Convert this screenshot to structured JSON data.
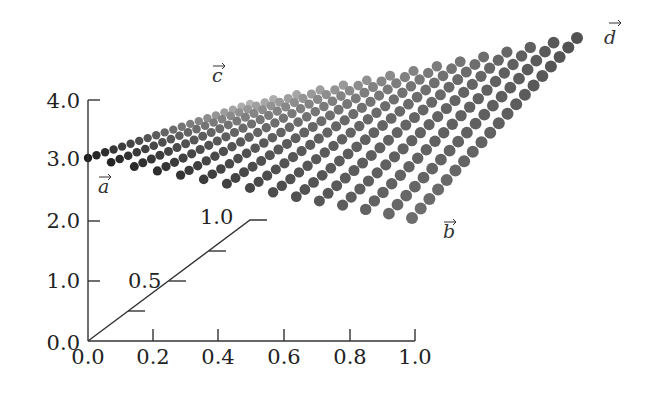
{
  "chart_data": {
    "type": "scatter",
    "subtype": "3d-bilinear-surface-dot-grid",
    "title": "",
    "xlabel": "",
    "ylabel": "",
    "x_axis": {
      "ticks": [
        0.0,
        0.2,
        0.4,
        0.6,
        0.8,
        1.0
      ],
      "tick_labels": [
        "0.0",
        "0.2",
        "0.4",
        "0.6",
        "0.8",
        "1.0"
      ],
      "range": [
        0.0,
        1.0
      ]
    },
    "z_axis": {
      "ticks": [
        0.0,
        1.0,
        2.0,
        3.0,
        4.0
      ],
      "tick_labels": [
        "0.0",
        "1.0",
        "2.0",
        "3.0",
        "4.0"
      ],
      "range": [
        0.0,
        4.0
      ]
    },
    "depth_axis": {
      "ticks": [
        0.25,
        0.5,
        0.75,
        1.0
      ],
      "labeled_ticks": [
        "0.5",
        "1.0"
      ],
      "range": [
        0.0,
        1.0
      ]
    },
    "corners": [
      {
        "name": "a",
        "label": "a⃗",
        "x": 0.0,
        "y": 0.0,
        "z": 3.0
      },
      {
        "name": "b",
        "label": "b⃗",
        "x": 1.0,
        "y": 0.0,
        "z": 2.0
      },
      {
        "name": "c",
        "label": "c⃗",
        "x": 0.0,
        "y": 1.0,
        "z": 4.0
      },
      {
        "name": "d",
        "label": "d⃗",
        "x": 1.0,
        "y": 1.0,
        "z": 4.4
      }
    ],
    "grid": {
      "u_samples": 15,
      "v_samples": 20
    },
    "shading": {
      "near_color": "#1a1a1a",
      "far_color": "#e0e0e0"
    },
    "grid_lines": false,
    "legend": null
  },
  "labels": {
    "z_ticks": [
      "4.0",
      "3.0",
      "2.0",
      "1.0",
      "0.0"
    ],
    "x_ticks": [
      "0.0",
      "0.2",
      "0.4",
      "0.6",
      "0.8",
      "1.0"
    ],
    "depth_ticks": [
      "0.5",
      "1.0"
    ],
    "vectors": {
      "a": "a",
      "b": "b",
      "c": "c",
      "d": "d"
    }
  }
}
